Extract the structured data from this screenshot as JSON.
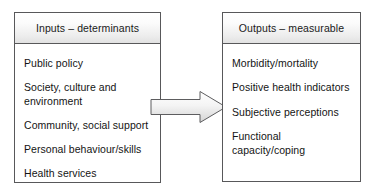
{
  "diagram": {
    "type": "flow-diagram",
    "colors": {
      "border": "#58585a",
      "shadow": "#a6a6a6",
      "header_gradient_top": "#ffffff",
      "header_gradient_bottom": "#e2e2e2",
      "arrow_fill_light": "#f2f2f2",
      "arrow_fill_dark": "#d9d9d9",
      "background": "#ffffff",
      "text": "#141414"
    },
    "boxes": [
      {
        "id": "inputs",
        "header": "Inputs – determinants",
        "items": [
          "Public policy",
          "Society, culture and\nenvironment",
          "Community, social support",
          "Personal behaviour/skills",
          "Health services"
        ]
      },
      {
        "id": "outputs",
        "header": "Outputs – measurable",
        "items": [
          "Morbidity/mortality",
          "Positive health indicators",
          "Subjective perceptions",
          "Functional capacity/coping"
        ]
      }
    ],
    "connector": {
      "name": "right-arrow",
      "from": "inputs",
      "to": "outputs",
      "direction": "right"
    }
  }
}
